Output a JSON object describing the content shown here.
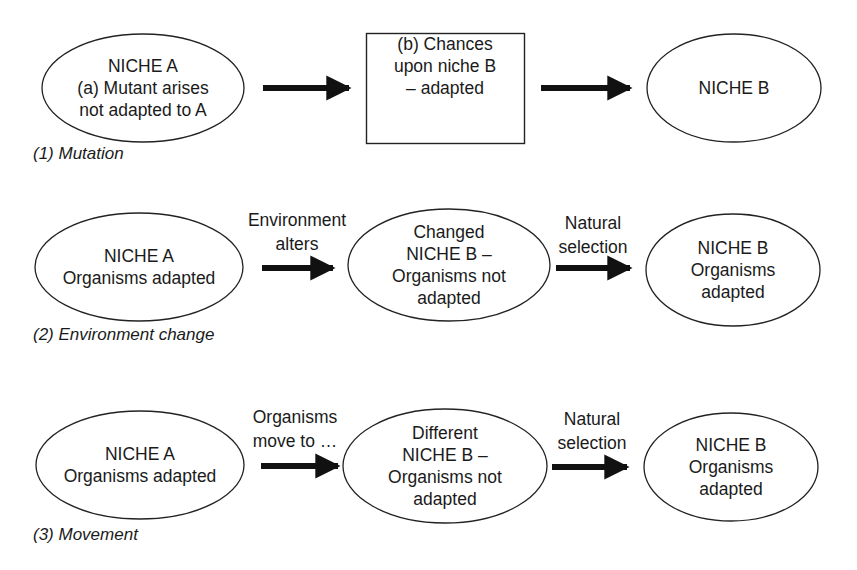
{
  "diagram": {
    "colors": {
      "stroke": "#222222",
      "arrow": "#111111",
      "text": "#1a1a1a",
      "background": "#ffffff"
    },
    "rows": [
      {
        "caption": "(1) Mutation",
        "nodes": [
          {
            "shape": "ellipse",
            "lines": [
              "NICHE A",
              "(a) Mutant arises",
              "not adapted to A"
            ]
          },
          {
            "shape": "rectangle",
            "lines": [
              "(b) Chances",
              "upon niche B",
              "– adapted"
            ]
          },
          {
            "shape": "ellipse",
            "lines": [
              "NICHE B"
            ]
          }
        ],
        "edges": [
          {
            "label_lines": []
          },
          {
            "label_lines": []
          }
        ]
      },
      {
        "caption": "(2) Environment change",
        "nodes": [
          {
            "shape": "ellipse",
            "lines": [
              "NICHE A",
              "Organisms adapted"
            ]
          },
          {
            "shape": "ellipse",
            "lines": [
              "Changed",
              "NICHE B –",
              "Organisms not",
              "adapted"
            ]
          },
          {
            "shape": "ellipse",
            "lines": [
              "NICHE B",
              "Organisms",
              "adapted"
            ]
          }
        ],
        "edges": [
          {
            "label_lines": [
              "Environment",
              "alters"
            ]
          },
          {
            "label_lines": [
              "Natural",
              "selection"
            ]
          }
        ]
      },
      {
        "caption": "(3) Movement",
        "nodes": [
          {
            "shape": "ellipse",
            "lines": [
              "NICHE A",
              "Organisms adapted"
            ]
          },
          {
            "shape": "ellipse",
            "lines": [
              "Different",
              "NICHE B –",
              "Organisms not",
              "adapted"
            ]
          },
          {
            "shape": "ellipse",
            "lines": [
              "NICHE B",
              "Organisms",
              "adapted"
            ]
          }
        ],
        "edges": [
          {
            "label_lines": [
              "Organisms",
              "move to …"
            ]
          },
          {
            "label_lines": [
              "Natural",
              "selection"
            ]
          }
        ]
      }
    ]
  }
}
